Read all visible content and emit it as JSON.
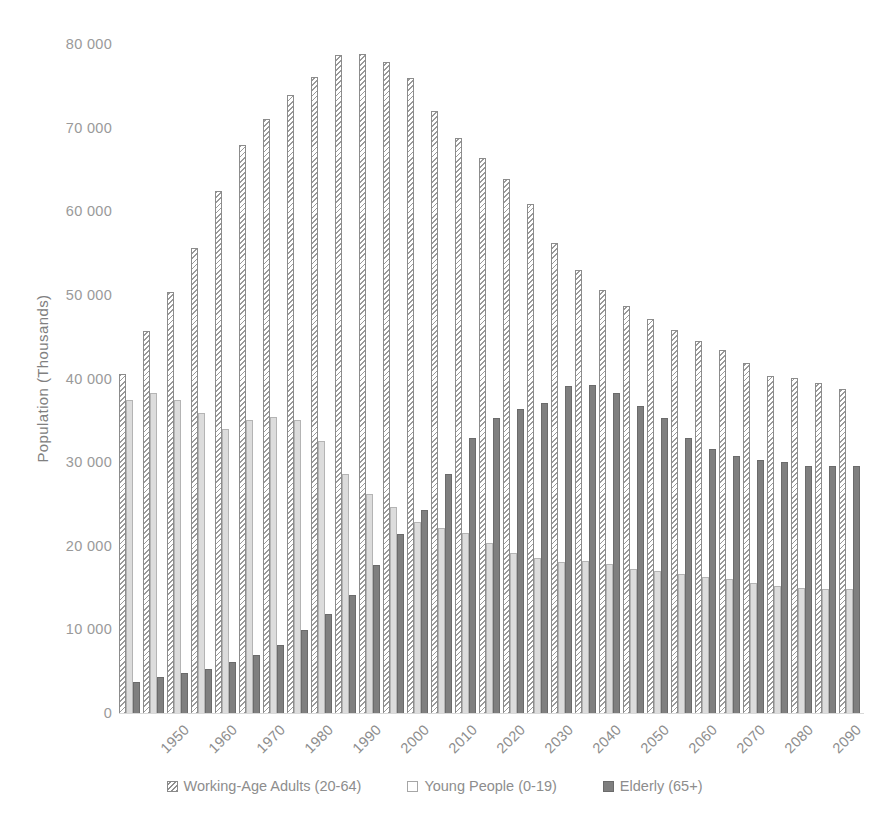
{
  "chart_data": {
    "type": "bar",
    "title": "",
    "xlabel": "",
    "ylabel": "Population (Thousands)",
    "ylim": [
      0,
      80000
    ],
    "y_ticks": [
      0,
      10000,
      20000,
      30000,
      40000,
      50000,
      60000,
      70000,
      80000
    ],
    "y_tick_labels": [
      "0",
      "10 000",
      "20 000",
      "30 000",
      "40 000",
      "50 000",
      "60 000",
      "70 000",
      "80 000"
    ],
    "grid": false,
    "legend_position": "bottom",
    "categories": [
      "1950",
      "1955",
      "1960",
      "1965",
      "1970",
      "1975",
      "1980",
      "1985",
      "1990",
      "1995",
      "2000",
      "2005",
      "2010",
      "2015",
      "2020",
      "2025",
      "2030",
      "2035",
      "2040",
      "2045",
      "2050",
      "2055",
      "2060",
      "2065",
      "2070",
      "2075",
      "2080",
      "2085",
      "2090",
      "2095",
      "2100"
    ],
    "x_tick_labels": [
      "1950",
      "1960",
      "1970",
      "1980",
      "1990",
      "2000",
      "2010",
      "2020",
      "2030",
      "2040",
      "2050",
      "2060",
      "2070",
      "2080",
      "2090",
      "2100"
    ],
    "series": [
      {
        "name": "Working-Age Adults (20-64)",
        "fill": "diagonal-hatch",
        "color": "#9a9a9a",
        "values": [
          40700,
          45800,
          50500,
          55700,
          62500,
          68000,
          71200,
          74000,
          76200,
          78800,
          78900,
          78000,
          76000,
          72100,
          68900,
          66500,
          64000,
          61000,
          56300,
          53100,
          50700,
          48800,
          47200,
          45900,
          44600,
          43500,
          42000,
          40400,
          40200,
          39600,
          38900
        ]
      },
      {
        "name": "Young People (0-19)",
        "fill": "light-solid",
        "color": "#dcdcdc",
        "values": [
          37600,
          38400,
          37600,
          36000,
          34100,
          35100,
          35500,
          35100,
          32700,
          28700,
          26300,
          24700,
          23000,
          22300,
          21600,
          20500,
          19300,
          18600,
          18200,
          18300,
          17900,
          17300,
          17100,
          16700,
          16400,
          16200,
          15700,
          15300,
          15100,
          15000,
          14900
        ]
      },
      {
        "name": "Elderly (65+)",
        "fill": "dark-solid",
        "color": "#7f7f7f",
        "values": [
          3800,
          4400,
          4900,
          5400,
          6200,
          7100,
          8300,
          10000,
          12000,
          14200,
          17800,
          21500,
          24400,
          28700,
          33000,
          35400,
          36500,
          37200,
          39200,
          39400,
          38400,
          36800,
          35400,
          33000,
          31700,
          30800,
          30400,
          30100,
          29600,
          29600,
          29600
        ]
      }
    ]
  },
  "legend": {
    "items": [
      {
        "label": "Working-Age Adults (20-64)",
        "style": "working"
      },
      {
        "label": "Young People (0-19)",
        "style": "young"
      },
      {
        "label": "Elderly (65+)",
        "style": "elderly"
      }
    ]
  },
  "caption": {
    "cut_off_text": ""
  }
}
